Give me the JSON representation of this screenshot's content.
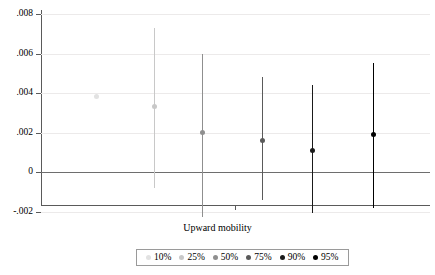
{
  "chart_data": {
    "type": "scatter",
    "title": "",
    "subtitle": "",
    "xlabel": "Upward mobility",
    "ylabel": "",
    "ylim": [
      -0.002,
      0.008
    ],
    "y_ticks": [
      0.008,
      0.006,
      0.004,
      0.002,
      0,
      -0.002
    ],
    "y_tick_labels": [
      ".008",
      ".006",
      ".004",
      ".002",
      "0",
      "-.002"
    ],
    "x_ticks": [
      1
    ],
    "x_tick_labels": [
      ""
    ],
    "grid": true,
    "zero_reference_line": 0,
    "legend_position": "bottom",
    "legend_entries": [
      "10%",
      "25%",
      "50%",
      "75%",
      "90%",
      "95%"
    ],
    "series": [
      {
        "name": "10%",
        "x_pos": 96,
        "estimate": 0.0038,
        "ci_low": 0.0038,
        "ci_high": 0.0038,
        "color": "#e2e2e2",
        "marker_size": 5
      },
      {
        "name": "25%",
        "x_pos": 154,
        "estimate": 0.0033,
        "ci_low": -0.0008,
        "ci_high": 0.0073,
        "color": "#c8c8c8",
        "marker_size": 5
      },
      {
        "name": "50%",
        "x_pos": 202,
        "estimate": 0.002,
        "ci_low": -0.0023,
        "ci_high": 0.006,
        "color": "#8f8f8f",
        "marker_size": 5
      },
      {
        "name": "75%",
        "x_pos": 262,
        "estimate": 0.0016,
        "ci_low": -0.0014,
        "ci_high": 0.0048,
        "color": "#5a5a5a",
        "marker_size": 5
      },
      {
        "name": "90%",
        "x_pos": 312,
        "estimate": 0.0011,
        "ci_low": -0.0021,
        "ci_high": 0.0044,
        "color": "#1a1a1a",
        "marker_size": 5.5
      },
      {
        "name": "95%",
        "x_pos": 373,
        "estimate": 0.0019,
        "ci_low": -0.0018,
        "ci_high": 0.0055,
        "color": "#000000",
        "marker_size": 5.5
      }
    ]
  },
  "colors": {
    "axis": "#5a5a5a",
    "gridline": "#eceaea",
    "zero_line": "#6e6e6e",
    "legend_border": "#9a9a9a",
    "background": "#ffffff"
  }
}
